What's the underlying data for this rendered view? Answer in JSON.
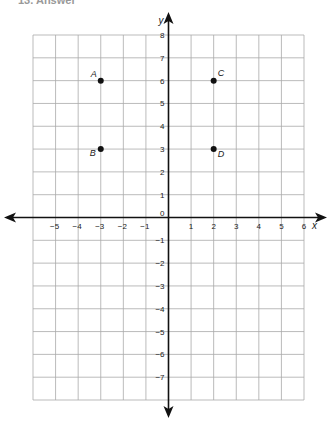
{
  "header": {
    "text": "13.   Answer"
  },
  "chart_data": {
    "type": "scatter",
    "title": "",
    "xlabel": "x",
    "ylabel": "y",
    "xlim": [
      -6,
      6
    ],
    "ylim": [
      -8,
      8
    ],
    "grid": true,
    "x_ticks": [
      -5,
      -4,
      -3,
      -2,
      -1,
      1,
      2,
      3,
      4,
      5,
      6
    ],
    "y_ticks": [
      8,
      7,
      6,
      5,
      4,
      3,
      2,
      1,
      0,
      -1,
      -2,
      -3,
      -4,
      -5,
      -6,
      -7
    ],
    "points": [
      {
        "label": "A",
        "x": -3,
        "y": 6
      },
      {
        "label": "B",
        "x": -3,
        "y": 3
      },
      {
        "label": "C",
        "x": 2,
        "y": 6
      },
      {
        "label": "D",
        "x": 2,
        "y": 3
      }
    ]
  }
}
